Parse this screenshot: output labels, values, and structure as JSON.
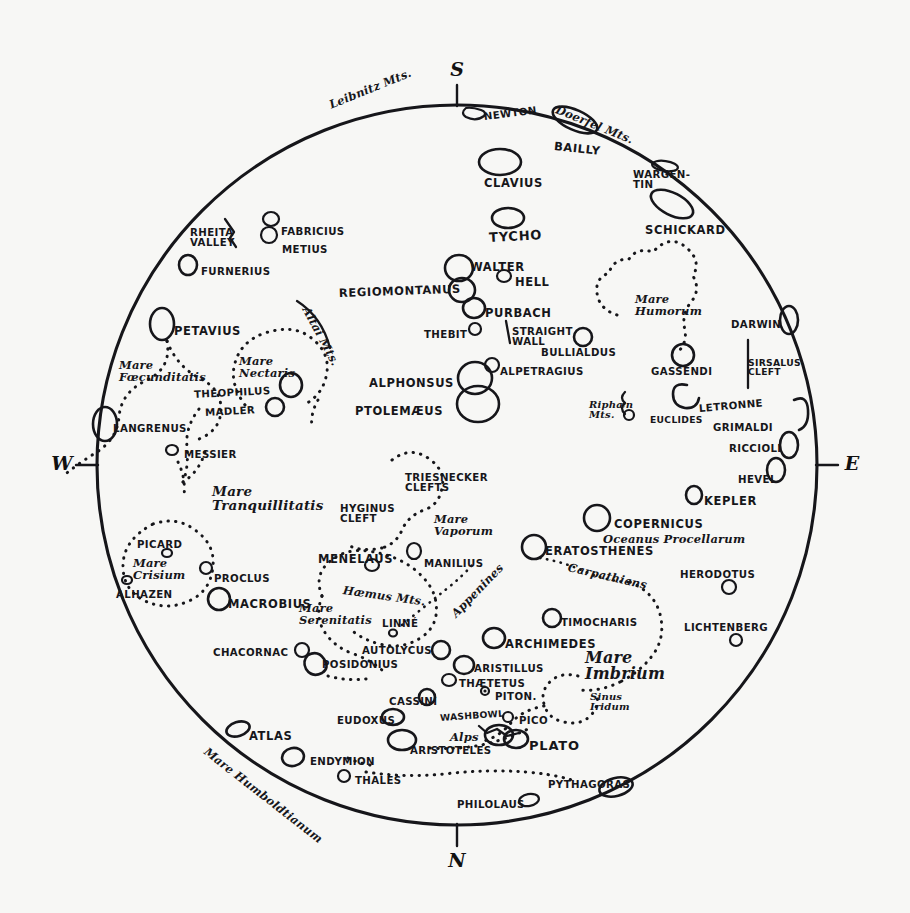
{
  "map": {
    "title": "Map of the Moon",
    "background_color": "#f7f7f5",
    "ink_color": "#16161a",
    "disc": {
      "cx": 457,
      "cy": 465,
      "r": 360
    }
  },
  "compass": {
    "south": "S",
    "north": "N",
    "east": "E",
    "west": "W"
  },
  "features": [
    {
      "name": "Leibnitz Mts.",
      "label": "Leibnitz Mts.",
      "style": "ital",
      "size": "sm",
      "x": 330,
      "y": 100,
      "rot": -22
    },
    {
      "name": "Newton",
      "label": "NEWTON",
      "style": "caps",
      "size": "sm",
      "x": 484,
      "y": 112,
      "rot": -7
    },
    {
      "name": "Doerfel Mts.",
      "label": "Doerfel Mts.",
      "style": "ital",
      "size": "sm",
      "x": 556,
      "y": 104,
      "rot": 22
    },
    {
      "name": "Bailly",
      "label": "BAILLY",
      "style": "caps",
      "size": "",
      "x": 554,
      "y": 141,
      "rot": 6
    },
    {
      "name": "Clavius",
      "label": "CLAVIUS",
      "style": "caps",
      "size": "",
      "x": 484,
      "y": 178,
      "rot": 0
    },
    {
      "name": "Wargentin",
      "label": "WARGEN-\nTIN",
      "style": "caps",
      "size": "sm",
      "x": 633,
      "y": 170,
      "rot": 0
    },
    {
      "name": "Schickard",
      "label": "SCHICKARD",
      "style": "caps",
      "size": "",
      "x": 645,
      "y": 225,
      "rot": 0
    },
    {
      "name": "Tycho",
      "label": "TYCHO",
      "style": "caps",
      "size": "lg",
      "x": 489,
      "y": 231,
      "rot": -3
    },
    {
      "name": "Rheita Valley",
      "label": "RHEITA\nVALLEY",
      "style": "caps",
      "size": "sm",
      "x": 190,
      "y": 228,
      "rot": 0
    },
    {
      "name": "Fabricius",
      "label": "FABRICIUS",
      "style": "caps",
      "size": "sm",
      "x": 281,
      "y": 227,
      "rot": 0
    },
    {
      "name": "Metius",
      "label": "METIUS",
      "style": "caps",
      "size": "sm",
      "x": 282,
      "y": 245,
      "rot": 0
    },
    {
      "name": "Furnerius",
      "label": "FURNERIUS",
      "style": "caps",
      "size": "sm",
      "x": 201,
      "y": 267,
      "rot": 0
    },
    {
      "name": "Walter",
      "label": "WALTER",
      "style": "caps",
      "size": "",
      "x": 470,
      "y": 262,
      "rot": 0
    },
    {
      "name": "Hell",
      "label": "HELL",
      "style": "caps",
      "size": "",
      "x": 515,
      "y": 277,
      "rot": 0
    },
    {
      "name": "Regiomontanus",
      "label": "REGIOMONTANUS",
      "style": "caps",
      "size": "",
      "x": 339,
      "y": 288,
      "rot": -2
    },
    {
      "name": "Purbach",
      "label": "PURBACH",
      "style": "caps",
      "size": "",
      "x": 485,
      "y": 308,
      "rot": 0
    },
    {
      "name": "Altai Mts.",
      "label": "Altai Mts.",
      "style": "ital",
      "size": "sm",
      "x": 305,
      "y": 302,
      "rot": 62
    },
    {
      "name": "Petavius",
      "label": "PETAVIUS",
      "style": "caps",
      "size": "",
      "x": 174,
      "y": 326,
      "rot": 0
    },
    {
      "name": "Mare Humorum",
      "label": "Mare\nHumorum",
      "style": "ital",
      "size": "sm",
      "x": 635,
      "y": 294,
      "rot": 0
    },
    {
      "name": "Darwin",
      "label": "DARWIN",
      "style": "caps",
      "size": "sm",
      "x": 731,
      "y": 320,
      "rot": 0
    },
    {
      "name": "Thebit",
      "label": "THEBIT",
      "style": "caps",
      "size": "sm",
      "x": 424,
      "y": 330,
      "rot": 0
    },
    {
      "name": "Straight Wall",
      "label": "STRAIGHT\nWALL",
      "style": "caps",
      "size": "sm",
      "x": 512,
      "y": 327,
      "rot": 0
    },
    {
      "name": "Bullialdus",
      "label": "BULLIALDUS",
      "style": "caps",
      "size": "sm",
      "x": 541,
      "y": 348,
      "rot": 0
    },
    {
      "name": "Mare Foecunditatis",
      "label": "Mare\nFœcunditatis",
      "style": "ital",
      "size": "sm",
      "x": 119,
      "y": 360,
      "rot": 0
    },
    {
      "name": "Mare Nectaris",
      "label": "Mare\nNectaris",
      "style": "ital",
      "size": "sm",
      "x": 239,
      "y": 356,
      "rot": 0
    },
    {
      "name": "Gassendi",
      "label": "GASSENDI",
      "style": "caps",
      "size": "sm",
      "x": 651,
      "y": 367,
      "rot": 0
    },
    {
      "name": "Sirsalus Cleft",
      "label": "SIRSALUS\nCLEFT",
      "style": "caps",
      "size": "xs",
      "x": 748,
      "y": 358,
      "rot": 0
    },
    {
      "name": "Alphonsus",
      "label": "ALPHONSUS",
      "style": "caps",
      "size": "",
      "x": 369,
      "y": 378,
      "rot": 0
    },
    {
      "name": "Alpetragius",
      "label": "ALPETRAGIUS",
      "style": "caps",
      "size": "sm",
      "x": 500,
      "y": 367,
      "rot": 0
    },
    {
      "name": "Theophilus",
      "label": "THEOPHILUS",
      "style": "caps",
      "size": "sm",
      "x": 194,
      "y": 390,
      "rot": -3
    },
    {
      "name": "Ptolemaeus",
      "label": "PTOLEMÆUS",
      "style": "caps",
      "size": "",
      "x": 355,
      "y": 406,
      "rot": 0
    },
    {
      "name": "Madler",
      "label": "MADLER",
      "style": "caps",
      "size": "sm",
      "x": 205,
      "y": 408,
      "rot": -3
    },
    {
      "name": "Riphaen Mts.",
      "label": "Riphæn\nMts.",
      "style": "ital",
      "size": "xs",
      "x": 589,
      "y": 400,
      "rot": 0
    },
    {
      "name": "Euclides",
      "label": "EUCLIDES",
      "style": "caps",
      "size": "xs",
      "x": 650,
      "y": 415,
      "rot": 0
    },
    {
      "name": "Letronne",
      "label": "LETRONNE",
      "style": "caps",
      "size": "sm",
      "x": 699,
      "y": 404,
      "rot": -5
    },
    {
      "name": "Grimaldi",
      "label": "GRIMALDI",
      "style": "caps",
      "size": "sm",
      "x": 713,
      "y": 423,
      "rot": 0
    },
    {
      "name": "Langrenus",
      "label": "LANGRENUS",
      "style": "caps",
      "size": "sm",
      "x": 113,
      "y": 424,
      "rot": 0
    },
    {
      "name": "Riccioli",
      "label": "RICCIOLI",
      "style": "caps",
      "size": "sm",
      "x": 729,
      "y": 444,
      "rot": 0
    },
    {
      "name": "Messier",
      "label": "MESSIER",
      "style": "caps",
      "size": "sm",
      "x": 184,
      "y": 450,
      "rot": 0
    },
    {
      "name": "Hevel",
      "label": "HEVEL",
      "style": "caps",
      "size": "sm",
      "x": 738,
      "y": 475,
      "rot": 0
    },
    {
      "name": "Mare Tranquillitatis",
      "label": "Mare\nTranquillitatis",
      "style": "ital",
      "size": "",
      "x": 212,
      "y": 485,
      "rot": 0
    },
    {
      "name": "Triesnecker Clefts",
      "label": "TRIESNECKER\nCLEFTS",
      "style": "caps",
      "size": "sm",
      "x": 405,
      "y": 473,
      "rot": 0
    },
    {
      "name": "Hyginus Cleft",
      "label": "HYGINUS\nCLEFT",
      "style": "caps",
      "size": "sm",
      "x": 340,
      "y": 504,
      "rot": 0
    },
    {
      "name": "Kepler",
      "label": "KEPLER",
      "style": "caps",
      "size": "",
      "x": 704,
      "y": 496,
      "rot": 0
    },
    {
      "name": "Copernicus",
      "label": "COPERNICUS",
      "style": "caps",
      "size": "",
      "x": 614,
      "y": 519,
      "rot": 0
    },
    {
      "name": "Mare Vaporum",
      "label": "Mare\nVaporum",
      "style": "ital",
      "size": "sm",
      "x": 434,
      "y": 514,
      "rot": 0
    },
    {
      "name": "Oceanus Procellarum",
      "label": "Oceanus Procellarum",
      "style": "ital",
      "size": "sm",
      "x": 603,
      "y": 534,
      "rot": 0
    },
    {
      "name": "Menelaus",
      "label": "MENELAUS",
      "style": "caps",
      "size": "",
      "x": 318,
      "y": 554,
      "rot": 0
    },
    {
      "name": "Manilius",
      "label": "MANILIUS",
      "style": "caps",
      "size": "sm",
      "x": 424,
      "y": 559,
      "rot": 0
    },
    {
      "name": "Eratosthenes",
      "label": "ERATOSTHENES",
      "style": "caps",
      "size": "",
      "x": 545,
      "y": 546,
      "rot": 0
    },
    {
      "name": "Carpathians",
      "label": "Carpathians",
      "style": "ital",
      "size": "sm",
      "x": 568,
      "y": 562,
      "rot": 13
    },
    {
      "name": "Herodotus",
      "label": "HERODOTUS",
      "style": "caps",
      "size": "sm",
      "x": 680,
      "y": 570,
      "rot": 0
    },
    {
      "name": "Picard",
      "label": "PICARD",
      "style": "caps",
      "size": "sm",
      "x": 137,
      "y": 540,
      "rot": 0
    },
    {
      "name": "Mare Crisium",
      "label": "Mare\nCrisium",
      "style": "ital",
      "size": "sm",
      "x": 133,
      "y": 558,
      "rot": 0
    },
    {
      "name": "Proclus",
      "label": "PROCLUS",
      "style": "caps",
      "size": "sm",
      "x": 214,
      "y": 574,
      "rot": 0
    },
    {
      "name": "Alhazen",
      "label": "ALHAZEN",
      "style": "caps",
      "size": "sm",
      "x": 116,
      "y": 590,
      "rot": 0
    },
    {
      "name": "Haemus Mts.",
      "label": "Hæmus Mts.",
      "style": "ital",
      "size": "sm",
      "x": 343,
      "y": 585,
      "rot": 8
    },
    {
      "name": "Macrobius",
      "label": "MACROBIUS",
      "style": "caps",
      "size": "",
      "x": 228,
      "y": 599,
      "rot": 0
    },
    {
      "name": "Mare Serenitatis",
      "label": "Mare\nSerenitatis",
      "style": "ital",
      "size": "sm",
      "x": 299,
      "y": 603,
      "rot": 0
    },
    {
      "name": "Linne",
      "label": "LINNÉ",
      "style": "caps",
      "size": "sm",
      "x": 382,
      "y": 619,
      "rot": 0
    },
    {
      "name": "Appenines",
      "label": "Appenines",
      "style": "ital",
      "size": "sm",
      "x": 454,
      "y": 610,
      "rot": -46
    },
    {
      "name": "Timocharis",
      "label": "TIMOCHARIS",
      "style": "caps",
      "size": "sm",
      "x": 561,
      "y": 618,
      "rot": 0
    },
    {
      "name": "Lichtenberg",
      "label": "LICHTENBERG",
      "style": "caps",
      "size": "sm",
      "x": 684,
      "y": 623,
      "rot": 0
    },
    {
      "name": "Archimedes",
      "label": "ARCHIMEDES",
      "style": "caps",
      "size": "",
      "x": 505,
      "y": 639,
      "rot": 0
    },
    {
      "name": "Chacornac",
      "label": "CHACORNAC",
      "style": "caps",
      "size": "sm",
      "x": 213,
      "y": 648,
      "rot": 0
    },
    {
      "name": "Autolycus",
      "label": "AUTOLYCUS",
      "style": "caps",
      "size": "sm",
      "x": 362,
      "y": 646,
      "rot": 0
    },
    {
      "name": "Posidonius",
      "label": "POSIDONIUS",
      "style": "caps",
      "size": "sm",
      "x": 322,
      "y": 660,
      "rot": 0
    },
    {
      "name": "Mare Imbrium",
      "label": "Mare\nImbrium",
      "style": "ital",
      "size": "lg",
      "x": 585,
      "y": 650,
      "rot": 0
    },
    {
      "name": "Aristillus",
      "label": "ARISTILLUS",
      "style": "caps",
      "size": "sm",
      "x": 474,
      "y": 664,
      "rot": 0
    },
    {
      "name": "Thaetetus",
      "label": "THÆTETUS",
      "style": "caps",
      "size": "sm",
      "x": 459,
      "y": 679,
      "rot": 0
    },
    {
      "name": "Piton",
      "label": "PITON.",
      "style": "caps",
      "size": "sm",
      "x": 495,
      "y": 692,
      "rot": 0
    },
    {
      "name": "Cassini",
      "label": "CASSINI",
      "style": "caps",
      "size": "sm",
      "x": 389,
      "y": 697,
      "rot": 0
    },
    {
      "name": "Sinus Iridum",
      "label": "Sinus\nIridum",
      "style": "ital",
      "size": "xs",
      "x": 590,
      "y": 692,
      "rot": 0
    },
    {
      "name": "Washbowl",
      "label": "WASHBOWL",
      "style": "caps",
      "size": "xs",
      "x": 440,
      "y": 713,
      "rot": -4
    },
    {
      "name": "Eudoxus",
      "label": "EUDOXUS",
      "style": "caps",
      "size": "sm",
      "x": 337,
      "y": 716,
      "rot": 0
    },
    {
      "name": "Pico",
      "label": "PICO",
      "style": "caps",
      "size": "sm",
      "x": 519,
      "y": 716,
      "rot": 0
    },
    {
      "name": "Alps",
      "label": "Alps",
      "style": "ital",
      "size": "sm",
      "x": 450,
      "y": 732,
      "rot": 0
    },
    {
      "name": "Plato",
      "label": "PLATO",
      "style": "caps",
      "size": "lg",
      "x": 529,
      "y": 739,
      "rot": 0
    },
    {
      "name": "Atlas",
      "label": "ATLAS",
      "style": "caps",
      "size": "",
      "x": 249,
      "y": 731,
      "rot": 0
    },
    {
      "name": "Aristoteles",
      "label": "ARISTOTELES",
      "style": "caps",
      "size": "sm",
      "x": 410,
      "y": 746,
      "rot": 0
    },
    {
      "name": "Endymion",
      "label": "ENDYMION",
      "style": "caps",
      "size": "sm",
      "x": 310,
      "y": 757,
      "rot": 0
    },
    {
      "name": "Mare Humboldtianum",
      "label": "Mare Humboldtianum",
      "style": "ital",
      "size": "sm",
      "x": 205,
      "y": 745,
      "rot": 38
    },
    {
      "name": "Thales",
      "label": "THALES",
      "style": "caps",
      "size": "sm",
      "x": 355,
      "y": 776,
      "rot": 0
    },
    {
      "name": "Pythagoras",
      "label": "PYTHAGORAS",
      "style": "caps",
      "size": "sm",
      "x": 548,
      "y": 780,
      "rot": 0
    },
    {
      "name": "Philolaus",
      "label": "PHILOLAUS",
      "style": "caps",
      "size": "sm",
      "x": 457,
      "y": 800,
      "rot": 0
    }
  ]
}
